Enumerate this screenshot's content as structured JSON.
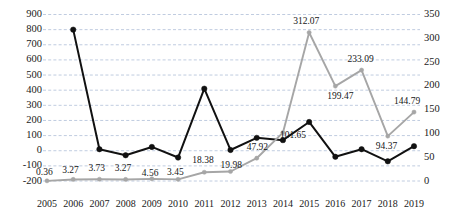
{
  "chart_data": {
    "type": "line",
    "title": "",
    "subtitle": "",
    "xlabel": "",
    "ylabel": "",
    "grid": true,
    "legend_position": "none",
    "categories": [
      "2005",
      "2006",
      "2007",
      "2008",
      "2009",
      "2010",
      "2011",
      "2012",
      "2013",
      "2014",
      "2015",
      "2016",
      "2017",
      "2018",
      "2019"
    ],
    "axes": {
      "left": {
        "ylim": [
          -200,
          900
        ],
        "step": 100,
        "ticks": [
          "900",
          "800",
          "700",
          "600",
          "500",
          "400",
          "300",
          "200",
          "100",
          "0",
          "-100",
          "-200"
        ]
      },
      "right": {
        "ylim": [
          0,
          350
        ],
        "step": 50,
        "ticks": [
          "350",
          "300",
          "250",
          "200",
          "150",
          "100",
          "50",
          "0"
        ]
      }
    },
    "series": [
      {
        "name": "black-series",
        "axis": "left",
        "color": "#111111",
        "marker": "circle",
        "show_labels": false,
        "values": [
          null,
          800,
          10,
          -30,
          25,
          -45,
          410,
          5,
          85,
          70,
          190,
          -40,
          10,
          -70,
          30
        ]
      },
      {
        "name": "gray-series",
        "axis": "right",
        "color": "#a6a6a6",
        "marker": "circle",
        "show_labels": true,
        "values": [
          0.36,
          3.27,
          3.73,
          3.27,
          4.56,
          3.45,
          18.38,
          19.98,
          47.92,
          101.65,
          312.07,
          199.47,
          233.09,
          94.37,
          144.79
        ],
        "labels": [
          "0.36",
          "3.27",
          "3.73",
          "3.27",
          "4.56",
          "3.45",
          "18.38",
          "19.98",
          "47.92",
          "101.65",
          "312.07",
          "199.47",
          "233.09",
          "94.37",
          "144.79"
        ]
      }
    ],
    "colors": {
      "gridline": "#b9c6dd",
      "black_series": "#111111",
      "gray_series": "#a6a6a6",
      "text": "#1a1a1a",
      "background": "#ffffff"
    }
  }
}
